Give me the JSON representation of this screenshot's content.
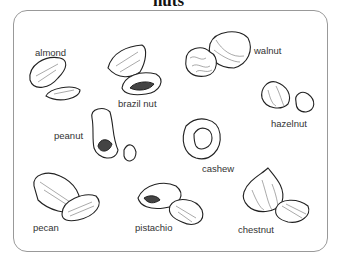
{
  "title": "nuts",
  "labels": {
    "almond": "almond",
    "brazil_nut": "brazil nut",
    "walnut": "walnut",
    "hazelnut": "hazelnut",
    "peanut": "peanut",
    "cashew": "cashew",
    "pecan": "pecan",
    "pistachio": "pistachio",
    "chestnut": "chestnut"
  }
}
